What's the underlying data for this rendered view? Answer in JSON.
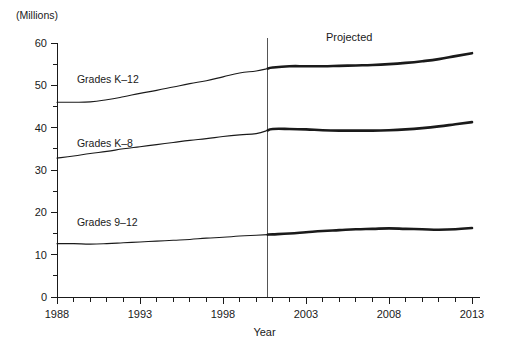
{
  "chart_data": {
    "type": "line",
    "title": "",
    "units_label": "(Millions)",
    "xlabel": "Year",
    "ylabel": "",
    "xlim": [
      1988,
      2013
    ],
    "ylim": [
      0,
      60
    ],
    "ytick_labels": [
      "0",
      "10",
      "20",
      "30",
      "40",
      "50",
      "60"
    ],
    "ytick_values": [
      0,
      10,
      20,
      30,
      40,
      50,
      60
    ],
    "yminor_step": 5,
    "xtick_labels": [
      "1988",
      "1993",
      "1998",
      "2003",
      "2008",
      "2013"
    ],
    "xtick_values": [
      1988,
      1993,
      1998,
      2003,
      2008,
      2013
    ],
    "xminor_step": 1,
    "grid": false,
    "legend_position": "inline-annotations",
    "line_color": "#1a1a1a",
    "annotations": [
      {
        "name": "projected-label",
        "text": "Projected",
        "x": 2005.6,
        "y": 61.5
      },
      {
        "name": "series-label-k12",
        "text": "Grades K–12",
        "x": 1989.2,
        "y": 51.5
      },
      {
        "name": "series-label-k8",
        "text": "Grades K–8",
        "x": 1989.2,
        "y": 36.4
      },
      {
        "name": "series-label-912",
        "text": "Grades 9–12",
        "x": 1989.2,
        "y": 17.6
      }
    ],
    "projection_divider_x": 2000.7,
    "x": [
      1988,
      1989,
      1990,
      1991,
      1992,
      1993,
      1994,
      1995,
      1996,
      1997,
      1998,
      1999,
      2000,
      2001,
      2002,
      2003,
      2004,
      2005,
      2006,
      2007,
      2008,
      2009,
      2010,
      2011,
      2012,
      2013
    ],
    "series": [
      {
        "name": "Grades K–12",
        "label": "Grades K–12",
        "values": [
          46.0,
          46.0,
          46.1,
          46.6,
          47.3,
          48.1,
          48.8,
          49.6,
          50.4,
          51.1,
          52.0,
          52.9,
          53.4,
          54.2,
          54.5,
          54.5,
          54.5,
          54.6,
          54.7,
          54.8,
          55.0,
          55.3,
          55.7,
          56.2,
          56.9,
          57.6
        ]
      },
      {
        "name": "Grades K–8",
        "label": "Grades K–8",
        "values": [
          32.8,
          33.3,
          33.9,
          34.4,
          35.0,
          35.5,
          36.0,
          36.5,
          37.0,
          37.4,
          37.9,
          38.3,
          38.6,
          39.7,
          39.7,
          39.6,
          39.4,
          39.3,
          39.3,
          39.3,
          39.4,
          39.6,
          39.9,
          40.3,
          40.8,
          41.3
        ]
      },
      {
        "name": "Grades 9–12",
        "label": "Grades 9–12",
        "values": [
          12.6,
          12.6,
          12.5,
          12.6,
          12.8,
          13.0,
          13.2,
          13.4,
          13.6,
          13.9,
          14.1,
          14.4,
          14.6,
          14.8,
          15.0,
          15.3,
          15.6,
          15.8,
          16.0,
          16.1,
          16.2,
          16.1,
          16.0,
          15.9,
          16.0,
          16.3
        ]
      }
    ]
  }
}
